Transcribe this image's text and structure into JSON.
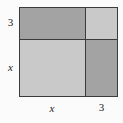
{
  "figure": {
    "type": "area-model-square",
    "colors": {
      "background": "#fbfbfb",
      "dark_fill": "#a3a3a3",
      "light_fill": "#c9c9c9",
      "stroke": "#3b3b3b",
      "label_text": "#1c1c1c"
    },
    "cells": [
      {
        "position": "top-left",
        "fill": "dark",
        "width_term": "x",
        "height_term": "3"
      },
      {
        "position": "top-right",
        "fill": "light",
        "width_term": "3",
        "height_term": "3"
      },
      {
        "position": "bottom-left",
        "fill": "light",
        "width_term": "x",
        "height_term": "x"
      },
      {
        "position": "bottom-right",
        "fill": "dark",
        "width_term": "3",
        "height_term": "x"
      }
    ]
  },
  "labels": {
    "left_top": "3",
    "left_bottom": "x",
    "bottom_left": "x",
    "bottom_right": "3"
  }
}
